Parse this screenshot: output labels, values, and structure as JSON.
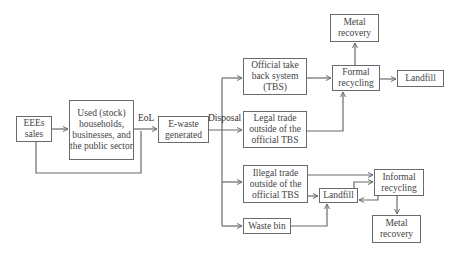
{
  "diagram": {
    "nodes": {
      "eees_sales": "EEEs sales",
      "used_stock": "Used (stock) households, businesses, and the public sector",
      "ewaste_generated": "E-waste generated",
      "official_tbs": "Official take back system (TBS)",
      "legal_trade": "Legal trade outside of the official TBS",
      "illegal_trade": "Illegal trade outside of the official TBS",
      "waste_bin": "Waste bin",
      "formal_recycling": "Formal recycling",
      "metal_recovery_top": "Metal recovery",
      "landfill_top": "Landfill",
      "landfill_mid": "Landfill",
      "informal_recycling": "Informal recycling",
      "metal_recovery_bottom": "Metal recovery"
    },
    "edge_labels": {
      "eol": "EoL",
      "disposal": "Disposal"
    },
    "colors": {
      "line": "#6a6a6a",
      "border": "#6a6a6a",
      "text": "#444444"
    }
  }
}
